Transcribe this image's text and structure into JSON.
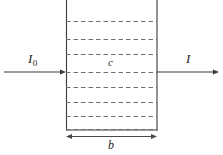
{
  "figure": {
    "type": "absorption-cell-diagram",
    "background_color": "#ffffff",
    "line_color": "#3a3a3a",
    "text_color": "#1c1c1c"
  },
  "labels": {
    "incident_beam": "I",
    "incident_beam_subscript": "0",
    "transmitted_beam": "I",
    "concentration": "c",
    "path_length": "b"
  },
  "cell": {
    "left_x": 66,
    "right_x": 157,
    "top_y": 0,
    "bottom_y": 130,
    "dashed_line_count": 8,
    "dashed_line_y": [
      21,
      39,
      54,
      72,
      87,
      102,
      116,
      130
    ]
  },
  "beam": {
    "axis_y": 72,
    "incident_start_x": 4,
    "incident_end_x": 66,
    "transmitted_start_x": 157,
    "transmitted_end_x": 218
  },
  "dimension": {
    "y": 141,
    "left_x": 66,
    "right_x": 157
  }
}
